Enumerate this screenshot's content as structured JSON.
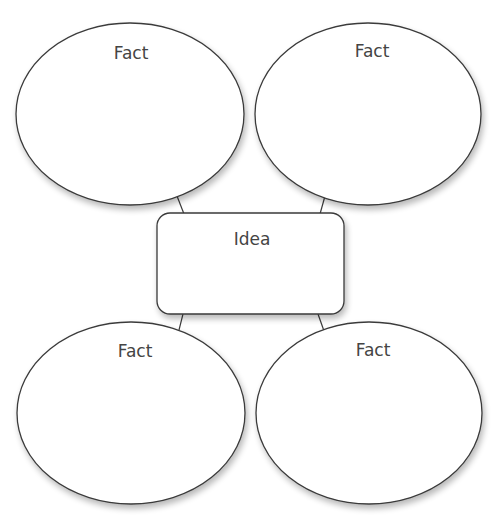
{
  "diagram": {
    "type": "idea-web graphic organizer",
    "center": {
      "label": "Idea",
      "shape": "rounded-rectangle"
    },
    "nodes": [
      {
        "label": "Fact",
        "position": "top-left",
        "shape": "ellipse"
      },
      {
        "label": "Fact",
        "position": "top-right",
        "shape": "ellipse"
      },
      {
        "label": "Fact",
        "position": "bottom-left",
        "shape": "ellipse"
      },
      {
        "label": "Fact",
        "position": "bottom-right",
        "shape": "ellipse"
      }
    ],
    "connections": [
      {
        "from": "Idea",
        "to": "top-left"
      },
      {
        "from": "Idea",
        "to": "top-right"
      },
      {
        "from": "Idea",
        "to": "bottom-left"
      },
      {
        "from": "Idea",
        "to": "bottom-right"
      }
    ],
    "colors": {
      "stroke": "#3a3a3a",
      "fill": "#ffffff",
      "text": "#444444",
      "background": "#ffffff"
    }
  }
}
